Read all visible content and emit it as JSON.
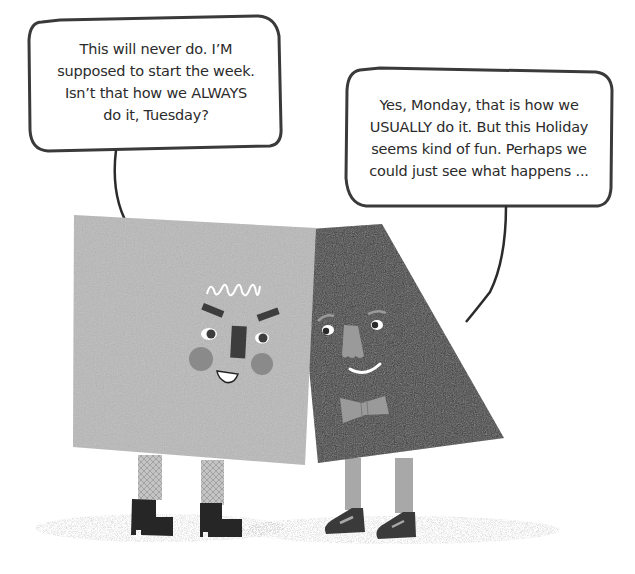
{
  "scene": {
    "background": "#ffffff",
    "ground_shadow": "#d8d8d8"
  },
  "bubbles": [
    {
      "speaker": "Monday",
      "lines": [
        "This will never do. I’M",
        "supposed to start the week.",
        "Isn’t that how we ALWAYS",
        "do it, Tuesday?"
      ]
    },
    {
      "speaker": "Tuesday",
      "lines": [
        "Yes, Monday, that is how we",
        "USUALLY do it. But this Holiday",
        "seems kind of fun. Perhaps we",
        "could just see what happens ..."
      ]
    }
  ],
  "characters": {
    "monday": {
      "shape": "square",
      "body_color": "#b9b9b9",
      "cheek_color": "#8a8a8a",
      "feature_color": "#3d3d3d",
      "footwear": "boots",
      "legwear": "patterned tights"
    },
    "tuesday": {
      "shape": "trapezoid",
      "body_color": "#3a3a3a",
      "nose_color": "#9a9a9a",
      "accessory": "bow tie",
      "footwear": "buckled shoes"
    }
  }
}
